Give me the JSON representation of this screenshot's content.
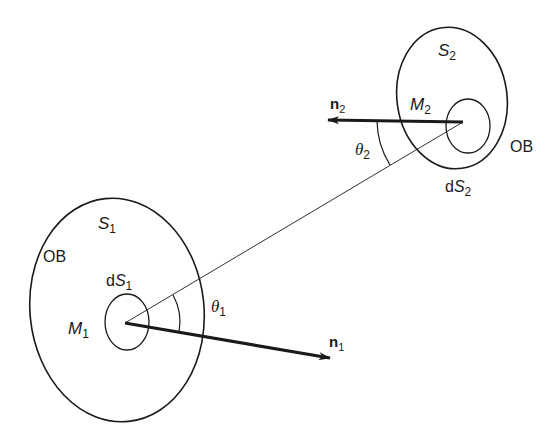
{
  "diagram": {
    "surface1": {
      "region_label": "S",
      "region_sub": "1",
      "outer_label": "OB",
      "element_label_prefix": "d",
      "element_label": "S",
      "element_sub": "1",
      "point_label": "M",
      "point_sub": "1",
      "normal_label": "n",
      "normal_sub": "1",
      "angle_label": "θ",
      "angle_sub": "1"
    },
    "surface2": {
      "region_label": "S",
      "region_sub": "2",
      "outer_label": "OB",
      "element_label_prefix": "d",
      "element_label": "S",
      "element_sub": "2",
      "point_label": "M",
      "point_sub": "2",
      "normal_label": "n",
      "normal_sub": "2",
      "angle_label": "θ",
      "angle_sub": "2"
    },
    "colors": {
      "stroke": "#1a1a1a",
      "background": "#ffffff"
    }
  }
}
